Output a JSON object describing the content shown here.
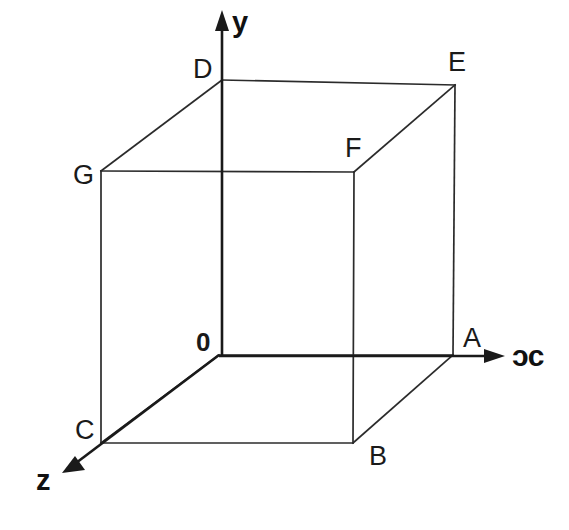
{
  "figure": {
    "background_color": "#ffffff",
    "line_color": "#2b2b2b",
    "axis_color": "#1a1a1a",
    "text_color": "#1a1a1a",
    "width": 569,
    "height": 530
  },
  "axes": [
    {
      "id": "x",
      "label": "ᴐc",
      "label_x": 512,
      "label_y": 343,
      "start": [
        219,
        355
      ],
      "end": [
        503,
        355
      ]
    },
    {
      "id": "y",
      "label": "y",
      "label_x": 232,
      "label_y": 8,
      "start": [
        222,
        355
      ],
      "end": [
        222,
        12
      ]
    },
    {
      "id": "z",
      "label": "z",
      "label_x": 36,
      "label_y": 466,
      "start": [
        219,
        355
      ],
      "end": [
        64,
        472
      ]
    }
  ],
  "vertices": [
    {
      "name": "O",
      "label": "0",
      "bold": true,
      "x": 219,
      "y": 355,
      "label_x": 196,
      "label_y": 329
    },
    {
      "name": "A",
      "label": "A",
      "bold": false,
      "x": 453,
      "y": 355,
      "label_x": 463,
      "label_y": 325
    },
    {
      "name": "B",
      "label": "B",
      "bold": false,
      "x": 353,
      "y": 443,
      "label_x": 369,
      "label_y": 443
    },
    {
      "name": "C",
      "label": "C",
      "bold": false,
      "x": 101,
      "y": 443,
      "label_x": 75,
      "label_y": 417
    },
    {
      "name": "D",
      "label": "D",
      "bold": false,
      "x": 222,
      "y": 80,
      "label_x": 193,
      "label_y": 56
    },
    {
      "name": "E",
      "label": "E",
      "bold": false,
      "x": 455,
      "y": 85,
      "label_x": 448,
      "label_y": 49
    },
    {
      "name": "F",
      "label": "F",
      "bold": false,
      "x": 354,
      "y": 172,
      "label_x": 345,
      "label_y": 135
    },
    {
      "name": "G",
      "label": "G",
      "bold": false,
      "x": 101,
      "y": 171,
      "label_x": 73,
      "label_y": 162
    }
  ],
  "edges": [
    {
      "from": "O",
      "to": "A",
      "kind": "bottom-back-right"
    },
    {
      "from": "O",
      "to": "C",
      "kind": "bottom-back-left-depth"
    },
    {
      "from": "C",
      "to": "B",
      "kind": "bottom-front"
    },
    {
      "from": "B",
      "to": "A",
      "kind": "bottom-right-depth"
    },
    {
      "from": "O",
      "to": "D",
      "kind": "vertical-back-left"
    },
    {
      "from": "A",
      "to": "E",
      "kind": "vertical-back-right"
    },
    {
      "from": "B",
      "to": "F",
      "kind": "vertical-front-right"
    },
    {
      "from": "C",
      "to": "G",
      "kind": "vertical-front-left"
    },
    {
      "from": "D",
      "to": "E",
      "kind": "top-back"
    },
    {
      "from": "D",
      "to": "G",
      "kind": "top-left-depth"
    },
    {
      "from": "G",
      "to": "F",
      "kind": "top-front"
    },
    {
      "from": "F",
      "to": "E",
      "kind": "top-right-depth"
    }
  ]
}
